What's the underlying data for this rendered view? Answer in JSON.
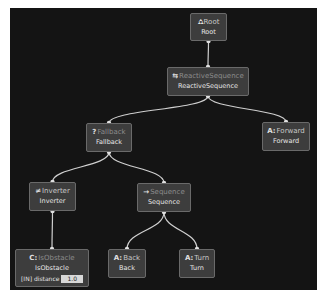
{
  "diagram": {
    "type": "behavior-tree",
    "nodes": [
      {
        "id": "root",
        "icon": "⛼",
        "icon_name": "root-icon",
        "title": "Root",
        "name": "Root"
      },
      {
        "id": "reactive",
        "icon": "⇆",
        "icon_name": "reactive-sequence-icon",
        "title": "ReactiveSequence",
        "name": "ReactiveSequence"
      },
      {
        "id": "fallback",
        "icon": "?",
        "icon_name": "fallback-icon",
        "title": "Fallback",
        "name": "Fallback"
      },
      {
        "id": "forward",
        "icon": "A:",
        "icon_name": "action-icon",
        "title": "Forward",
        "name": "Forward"
      },
      {
        "id": "inverter",
        "icon": "≠",
        "icon_name": "inverter-icon",
        "title": "Inverter",
        "name": "Inverter"
      },
      {
        "id": "sequence",
        "icon": "→",
        "icon_name": "sequence-icon",
        "title": "Sequence",
        "name": "Sequence"
      },
      {
        "id": "isobstacle",
        "icon": "C:",
        "icon_name": "condition-icon",
        "title": "IsObstacle",
        "name": "IsObstacle",
        "port": {
          "direction": "[IN]",
          "label": "distance",
          "value": "1.0"
        }
      },
      {
        "id": "back",
        "icon": "A:",
        "icon_name": "action-icon",
        "title": "Back",
        "name": "Back"
      },
      {
        "id": "turn",
        "icon": "A:",
        "icon_name": "action-icon",
        "title": "Turn",
        "name": "Turn"
      }
    ],
    "edges": [
      [
        "root",
        "reactive"
      ],
      [
        "reactive",
        "fallback"
      ],
      [
        "reactive",
        "forward"
      ],
      [
        "fallback",
        "inverter"
      ],
      [
        "fallback",
        "sequence"
      ],
      [
        "inverter",
        "isobstacle"
      ],
      [
        "sequence",
        "back"
      ],
      [
        "sequence",
        "turn"
      ]
    ]
  }
}
